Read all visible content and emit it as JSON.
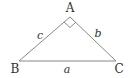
{
  "diagram": {
    "type": "right-triangle",
    "vertices": {
      "A": {
        "label": "A",
        "x": 70,
        "y": 17
      },
      "B": {
        "label": "B",
        "x": 19,
        "y": 61
      },
      "C": {
        "label": "C",
        "x": 116,
        "y": 61
      }
    },
    "sides": {
      "a": {
        "label": "a",
        "between": [
          "B",
          "C"
        ]
      },
      "b": {
        "label": "b",
        "between": [
          "A",
          "C"
        ]
      },
      "c": {
        "label": "c",
        "between": [
          "A",
          "B"
        ]
      }
    },
    "right_angle_at": "A",
    "line_color": "#888888",
    "text_color": "#333333"
  }
}
